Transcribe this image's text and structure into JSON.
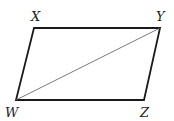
{
  "diagram": {
    "type": "parallelogram",
    "vertices": {
      "X": {
        "label": "X",
        "x": 34,
        "y": 28
      },
      "Y": {
        "label": "Y",
        "x": 160,
        "y": 28
      },
      "Z": {
        "label": "Z",
        "x": 144,
        "y": 100
      },
      "W": {
        "label": "W",
        "x": 16,
        "y": 100
      }
    },
    "diagonal": [
      "W",
      "Y"
    ],
    "colors": {
      "stroke": "#1a1a1a",
      "diagonal": "#555555"
    }
  }
}
